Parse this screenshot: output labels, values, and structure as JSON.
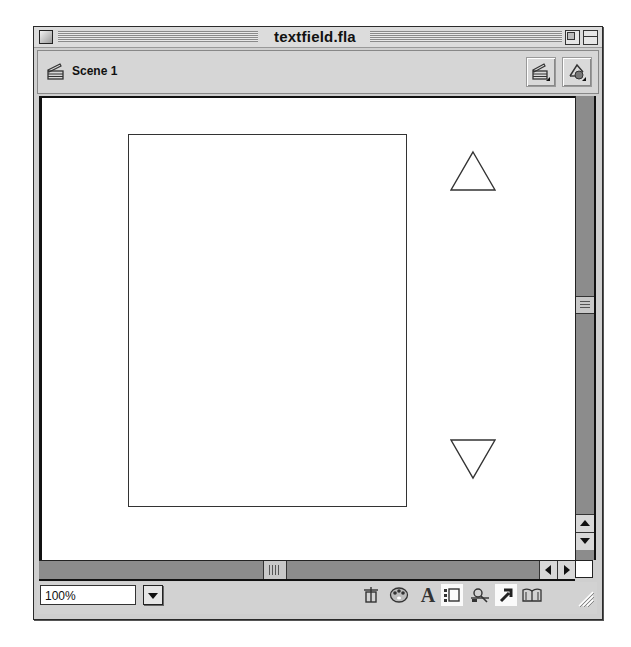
{
  "window": {
    "title": "textfield.fla",
    "controls": {
      "close": "close-box",
      "zoom": "zoom-box",
      "collapse": "collapse-box"
    }
  },
  "scene_bar": {
    "scene_label": "Scene 1",
    "scene_icon": "clapperboard-icon",
    "buttons": [
      {
        "name": "edit-scene",
        "icon": "clapperboard-dropdown-icon"
      },
      {
        "name": "edit-symbols",
        "icon": "shapes-dropdown-icon"
      }
    ]
  },
  "stage": {
    "background": "#ffffff",
    "objects": [
      {
        "type": "rectangle",
        "name": "text-field-frame",
        "stroke": "#333333"
      },
      {
        "type": "triangle-up",
        "name": "scroll-up-shape",
        "stroke": "#333333"
      },
      {
        "type": "triangle-down",
        "name": "scroll-down-shape",
        "stroke": "#333333"
      }
    ]
  },
  "scrollbars": {
    "vertical": {
      "thumb_position": "middle",
      "up_arrow": "▲",
      "down_arrow": "▼"
    },
    "horizontal": {
      "thumb_position": "middle",
      "left_arrow": "◀",
      "right_arrow": "▶"
    }
  },
  "status_bar": {
    "zoom_value": "100%",
    "zoom_dropdown_icon": "triangle-down-icon",
    "launcher_icons": [
      {
        "name": "info",
        "glyph": "⊞"
      },
      {
        "name": "color-palette",
        "glyph": "🎨"
      },
      {
        "name": "character",
        "glyph": "A"
      },
      {
        "name": "align",
        "glyph": "⁝"
      },
      {
        "name": "movie-explorer",
        "glyph": "⌕"
      },
      {
        "name": "actions",
        "glyph": "↗"
      },
      {
        "name": "library",
        "glyph": "📖"
      }
    ]
  },
  "colors": {
    "chrome": "#cfcfcf",
    "scrollbar_track": "#8c8c8c",
    "stage": "#ffffff",
    "border_dark": "#111111"
  }
}
